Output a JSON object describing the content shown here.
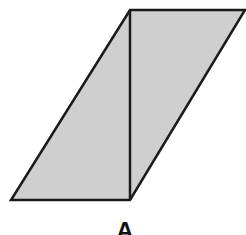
{
  "diagram": {
    "shape": "parallelogram",
    "fill_color": "#cfcfcf",
    "stroke_color": "#1a1a1a",
    "vertices": {
      "top_left": [
        130,
        10
      ],
      "top_right": [
        245,
        10
      ],
      "bottom_right": [
        130,
        200
      ],
      "bottom_left": [
        11,
        200
      ]
    },
    "diagonal": {
      "from": [
        130,
        10
      ],
      "to": [
        130,
        200
      ]
    },
    "label": "A"
  }
}
